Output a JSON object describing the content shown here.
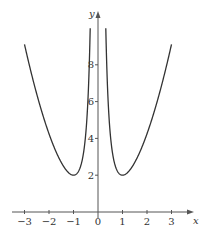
{
  "chart_data": {
    "type": "line",
    "title": "",
    "function": "y = x^2 + 1/x^2",
    "xlabel": "x",
    "ylabel": "y",
    "xlim": [
      -3.3,
      3.3
    ],
    "ylim": [
      0,
      10
    ],
    "x_ticks": [
      -3,
      -2,
      -1,
      0,
      1,
      2,
      3
    ],
    "x_tick_labels": [
      "−3",
      "−2",
      "−1",
      "0",
      "1",
      "2",
      "3"
    ],
    "y_ticks": [
      2,
      4,
      6,
      8
    ],
    "y_tick_labels": [
      "2",
      "4",
      "6",
      "8"
    ],
    "grid": false,
    "legend": null,
    "series": [
      {
        "name": "left branch",
        "x": [
          -3,
          -2.5,
          -2,
          -1.5,
          -1,
          -0.7,
          -0.5,
          -0.4,
          -0.33
        ],
        "y": [
          9.1,
          6.41,
          4.25,
          2.69,
          2,
          2.53,
          4.25,
          6.41,
          9.29
        ]
      },
      {
        "name": "right branch",
        "x": [
          0.33,
          0.4,
          0.5,
          0.7,
          1,
          1.5,
          2,
          2.5,
          3
        ],
        "y": [
          9.29,
          6.41,
          4.25,
          2.53,
          2,
          2.69,
          4.25,
          6.41,
          9.1
        ]
      }
    ],
    "annotations": [
      "minimum y = 2 at x = -1 and x = 1"
    ]
  },
  "axes": {
    "x_name": "x",
    "y_name": "y"
  },
  "colors": {
    "curve": "#333333",
    "axis": "#555555"
  }
}
